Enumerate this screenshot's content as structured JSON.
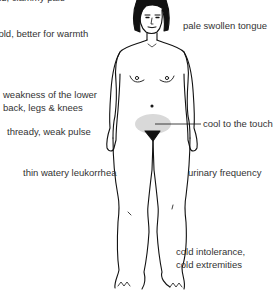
{
  "diagram": {
    "highlight_color": "#d9d9d9",
    "line_color": "#111111",
    "text_color": "#333333"
  },
  "labels": {
    "top_left_line1": "aversion to cold, clammy pale",
    "top_left_line2": "face",
    "top_left_line3": "worse for cold, better for warmth",
    "tongue": "pale swollen tongue",
    "back_line1": "weakness of the lower",
    "back_line2": "back, legs & knees",
    "pulse": "thready, weak pulse",
    "abdomen": "cool to the touch",
    "leukorrhea": "thin watery leukorrhea",
    "urinary": "urinary frequency",
    "cold_line1": "cold intolerance,",
    "cold_line2": "cold extremities"
  }
}
